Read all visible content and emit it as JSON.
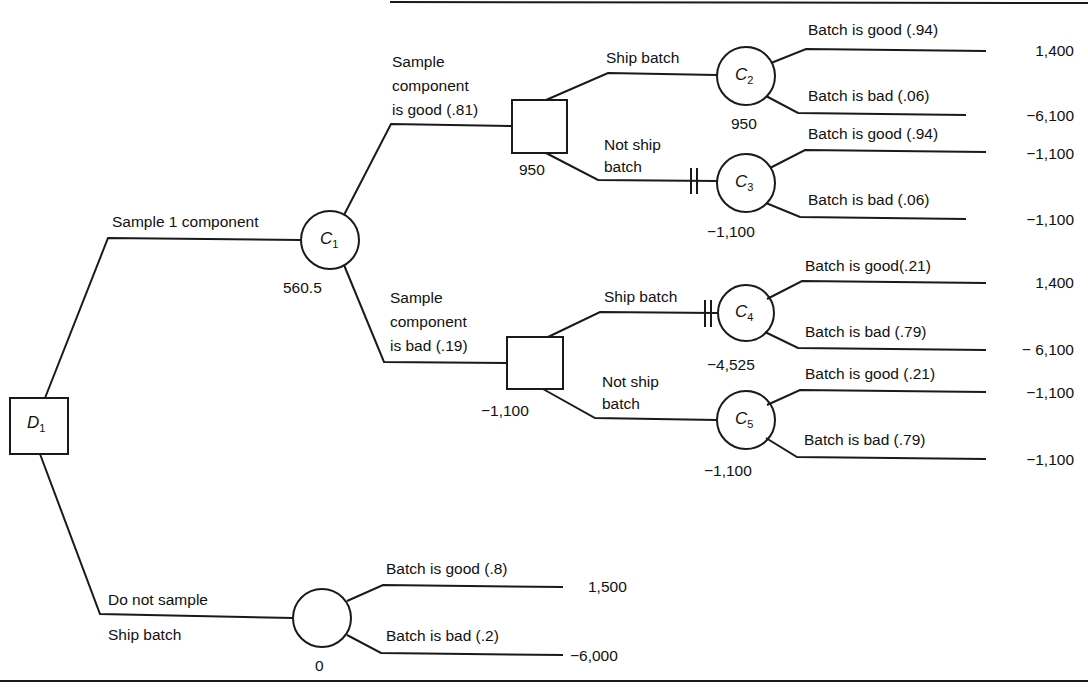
{
  "diagram": {
    "type": "decision-tree",
    "nodes": {
      "D1": {
        "label": "D",
        "sub": "1",
        "kind": "decision"
      },
      "C1": {
        "label": "C",
        "sub": "1",
        "kind": "chance",
        "value": "560.5"
      },
      "B1": {
        "kind": "decision",
        "value": "950"
      },
      "B2": {
        "kind": "decision",
        "value": "−1,100"
      },
      "C2": {
        "label": "C",
        "sub": "2",
        "kind": "chance",
        "value": "950"
      },
      "C3": {
        "label": "C",
        "sub": "3",
        "kind": "chance",
        "value": "−1,100"
      },
      "C4": {
        "label": "C",
        "sub": "4",
        "kind": "chance",
        "value": "−4,525"
      },
      "C5": {
        "label": "C",
        "sub": "5",
        "kind": "chance",
        "value": "−1,100"
      },
      "C0": {
        "kind": "chance",
        "value": "0"
      }
    },
    "branches": {
      "sample": "Sample 1 component",
      "no_sample_1": "Do not sample",
      "no_sample_2": "Ship batch",
      "good_sample": [
        "Sample",
        "component",
        "is good (.81)"
      ],
      "bad_sample": [
        "Sample",
        "component",
        "is bad (.19)"
      ],
      "b1_ship": "Ship batch",
      "b1_not_ship": [
        "Not ship",
        "batch"
      ],
      "b2_ship": "Ship batch",
      "b2_not_ship": [
        "Not ship",
        "batch"
      ],
      "c2_good": "Batch is good (.94)",
      "c2_bad": "Batch is bad (.06)",
      "c3_good": "Batch is good (.94)",
      "c3_bad": "Batch is bad (.06)",
      "c4_good": "Batch is good(.21)",
      "c4_bad": "Batch is bad (.79)",
      "c5_good": "Batch is good (.21)",
      "c5_bad": "Batch is bad (.79)",
      "c0_good": "Batch is good (.8)",
      "c0_bad": "Batch is bad (.2)"
    },
    "payoffs": {
      "c2_good": "1,400",
      "c2_bad": "−6,100",
      "c3_good": "−1,100",
      "c3_bad": "−1,100",
      "c4_good": "1,400",
      "c4_bad": "− 6,100",
      "c5_good": "−1,100",
      "c5_bad": "−1,100",
      "c0_good": "1,500",
      "c0_bad": "−6,000"
    },
    "colors": {
      "line": "#1a1a1a",
      "background": "#ffffff"
    }
  }
}
